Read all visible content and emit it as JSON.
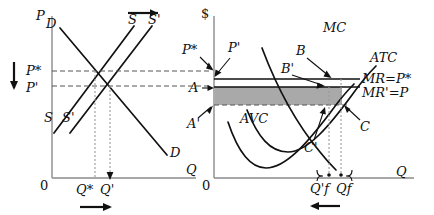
{
  "figure": {
    "kind": "economics-diagram",
    "title_visible": false,
    "panels": [
      {
        "id": "market",
        "axis_y_label": "P",
        "axis_x_label": "Q",
        "origin_label": "0",
        "curve_labels": {
          "demand_top": "D",
          "demand_bottom": "D",
          "supply_bottom": "S",
          "supply_shifted_bottom": "S'",
          "supply_top": "S",
          "supply_shifted_top": "S'"
        },
        "price_labels": {
          "initial": "P*",
          "new": "P'"
        },
        "quantity_labels": {
          "initial": "Q*",
          "new": "Q'"
        },
        "shift_arrows": {
          "supply_shift": "right",
          "price_change": "down",
          "quantity_change": "right"
        }
      },
      {
        "id": "firm",
        "axis_y_label": "$",
        "axis_x_label": "Q",
        "origin_label": "0",
        "curve_labels": {
          "marginal_cost": "MC",
          "average_total_cost": "ATC",
          "average_variable_cost": "AVC"
        },
        "revenue_lines": {
          "initial": "MR=P*",
          "new": "MR'=P"
        },
        "price_pointers": {
          "initial": "P*",
          "new": "P'"
        },
        "cost_pointers": {
          "initial": "A",
          "new": "A'"
        },
        "equilibrium_points": {
          "initial": "B",
          "new": "B'"
        },
        "atc_points": {
          "initial": "C",
          "new": "C'"
        },
        "quantity_labels": {
          "new": "Q'f",
          "initial": "Qf"
        },
        "shift_arrows": {
          "quantity_change": "left"
        },
        "shaded_region": {
          "description": "economic-profit-rectangle",
          "color": "#a9a9a9"
        }
      }
    ],
    "colors": {
      "axis": "#8a8a8a",
      "curve": "#111111",
      "shade": "#a9a9a9",
      "dash": "#555555"
    }
  }
}
